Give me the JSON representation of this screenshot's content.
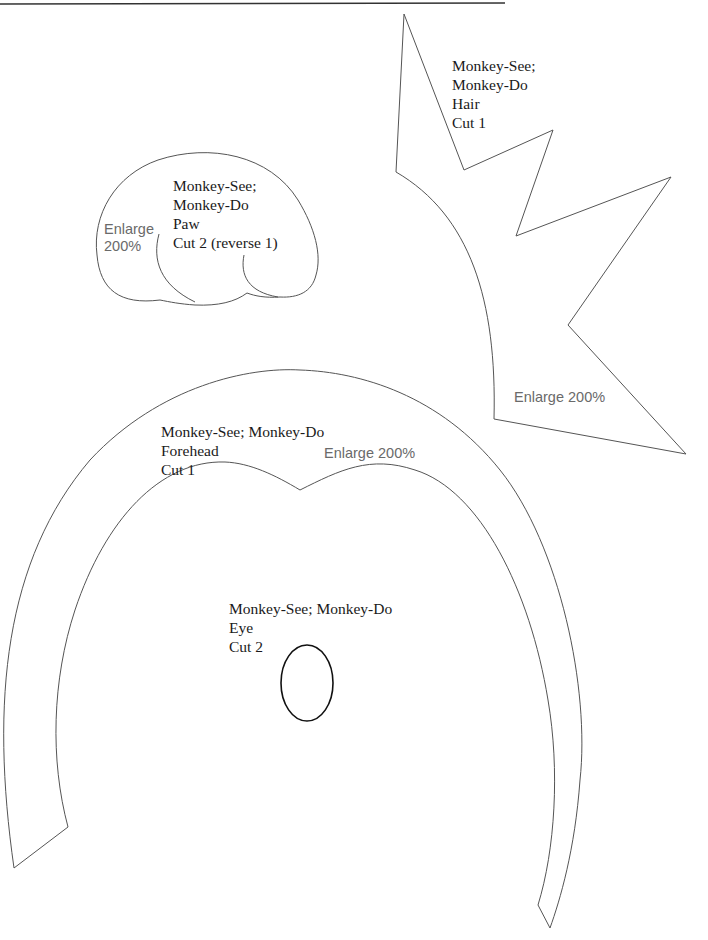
{
  "pieces": {
    "hair": {
      "lines": [
        "Monkey-See;",
        "Monkey-Do",
        "Hair",
        "Cut 1"
      ],
      "enlarge": "Enlarge 200%"
    },
    "paw": {
      "lines": [
        "Monkey-See;",
        "Monkey-Do",
        "Paw",
        "Cut 2 (reverse 1)"
      ],
      "enlarge_lines": [
        "Enlarge",
        "200%"
      ]
    },
    "forehead": {
      "lines": [
        "Monkey-See; Monkey-Do",
        "Forehead",
        "Cut 1"
      ],
      "enlarge": "Enlarge 200%"
    },
    "eye": {
      "lines": [
        "Monkey-See; Monkey-Do",
        "Eye",
        "Cut 2"
      ]
    }
  },
  "colors": {
    "outline": "#555555",
    "text": "#1a1a1a",
    "enlarge_text": "#6a6a6a",
    "eye_outline": "#111111"
  }
}
